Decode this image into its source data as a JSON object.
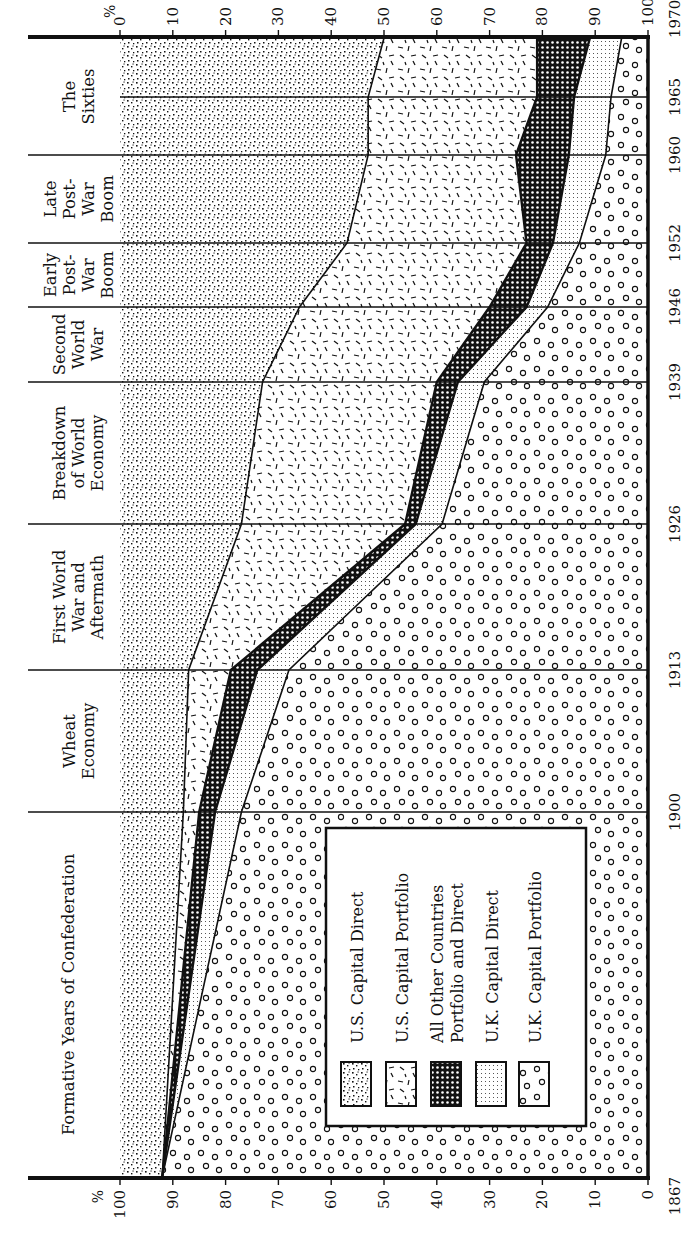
{
  "chart_data": {
    "type": "area",
    "orientation": "rotated-90-clockwise",
    "title": "",
    "xlabel": "",
    "ylabel": "%",
    "stacked": true,
    "ylim": [
      0,
      100
    ],
    "x": [
      1867,
      1900,
      1913,
      1926,
      1939,
      1946,
      1952,
      1960,
      1965,
      1970
    ],
    "x_tick_labels": [
      "1867",
      "1900",
      "1913",
      "1926",
      "1939",
      "1946",
      "1952",
      "1960",
      "1965",
      "1970"
    ],
    "y_tick_labels_bottom": [
      "100",
      "90",
      "80",
      "70",
      "60",
      "50",
      "40",
      "30",
      "20",
      "10",
      "0"
    ],
    "y_tick_labels_top": [
      "0",
      "10",
      "20",
      "30",
      "40",
      "50",
      "60",
      "70",
      "80",
      "90",
      "100"
    ],
    "percent_symbol": "%",
    "series": [
      {
        "name": "U.S. Capital Direct",
        "pattern": "dense-dots",
        "values": [
          8,
          12,
          13,
          23,
          27,
          34,
          43,
          47,
          47,
          50
        ]
      },
      {
        "name": "U.S. Capital Portfolio",
        "pattern": "dashes",
        "values": [
          0,
          3,
          8,
          31,
          33,
          36,
          34,
          28,
          32,
          29
        ]
      },
      {
        "name": "All Other Countries Portfolio and Direct",
        "pattern": "crosshatch",
        "values": [
          0,
          3,
          5,
          2,
          4,
          7,
          5,
          10,
          7,
          10
        ]
      },
      {
        "name": "U.K. Capital Direct",
        "pattern": "fine-dots",
        "values": [
          0,
          5,
          6,
          5,
          5,
          4,
          5,
          7,
          7,
          6
        ]
      },
      {
        "name": "U.K. Capital Portfolio",
        "pattern": "circles",
        "values": [
          92,
          77,
          68,
          39,
          31,
          19,
          13,
          8,
          7,
          5
        ]
      }
    ],
    "cumulative_boundaries": {
      "us_direct_top": [
        8,
        12,
        13,
        23,
        27,
        34,
        43,
        47,
        47,
        50
      ],
      "us_portfolio_top": [
        8,
        15,
        21,
        54,
        60,
        70,
        77,
        75,
        79,
        79
      ],
      "other_top": [
        8,
        18,
        26,
        56,
        64,
        77,
        82,
        85,
        86,
        89
      ],
      "uk_direct_top": [
        8,
        23,
        32,
        61,
        69,
        81,
        87,
        92,
        93,
        95
      ]
    },
    "periods": [
      {
        "label": "Formative Years of Confederation",
        "from": 1867,
        "to": 1900
      },
      {
        "label": "Wheat Economy",
        "from": 1900,
        "to": 1913
      },
      {
        "label": "First World War and Aftermath",
        "from": 1913,
        "to": 1926
      },
      {
        "label": "Breakdown of World Economy",
        "from": 1926,
        "to": 1939
      },
      {
        "label": "Second World War",
        "from": 1939,
        "to": 1946
      },
      {
        "label": "Early Post-War Boom",
        "from": 1946,
        "to": 1952
      },
      {
        "label": "Late Post-War Boom",
        "from": 1952,
        "to": 1960
      },
      {
        "label": "The Sixties",
        "from": 1960,
        "to": 1970
      }
    ],
    "legend_position": "inside-lower-center",
    "grid": false
  },
  "legend": {
    "items": [
      {
        "label": "U.S. Capital Direct",
        "pattern": "dense-dots"
      },
      {
        "label": "U.S. Capital Portfolio",
        "pattern": "dashes"
      },
      {
        "label": "All Other Countries",
        "label2": "Portfolio and Direct",
        "pattern": "crosshatch"
      },
      {
        "label": "U.K. Capital Direct",
        "pattern": "fine-dots"
      },
      {
        "label": "U.K. Capital Portfolio",
        "pattern": "circles"
      }
    ]
  },
  "period_labels": [
    {
      "lines": [
        "Formative Years of Confederation"
      ]
    },
    {
      "lines": [
        "Wheat",
        "Economy"
      ]
    },
    {
      "lines": [
        "First World",
        "War and",
        "Aftermath"
      ]
    },
    {
      "lines": [
        "Breakdown",
        "of World",
        "Economy"
      ]
    },
    {
      "lines": [
        "Second",
        "World",
        "War"
      ]
    },
    {
      "lines": [
        "Early",
        "Post-",
        "War",
        "Boom"
      ]
    },
    {
      "lines": [
        "Late",
        "Post-",
        "War",
        "Boom"
      ]
    },
    {
      "lines": [
        "The",
        "Sixties"
      ]
    }
  ],
  "colors": {
    "ink": "#111111",
    "paper": "#ffffff"
  }
}
